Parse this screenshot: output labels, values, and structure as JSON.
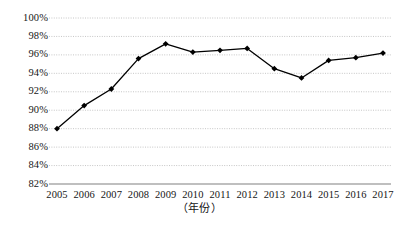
{
  "chart_data": {
    "type": "line",
    "title": "",
    "subtitle": "",
    "xlabel": "（年份）",
    "ylabel": "",
    "categories": [
      "2005",
      "2006",
      "2007",
      "2008",
      "2009",
      "2010",
      "2011",
      "2012",
      "2013",
      "2014",
      "2015",
      "2016",
      "2017"
    ],
    "values": [
      88.0,
      90.5,
      92.3,
      95.6,
      97.2,
      96.3,
      96.5,
      96.7,
      94.5,
      93.5,
      95.4,
      95.7,
      96.2
    ],
    "series": [
      {
        "name": "",
        "values": [
          88.0,
          90.5,
          92.3,
          95.6,
          97.2,
          96.3,
          96.5,
          96.7,
          94.5,
          93.5,
          95.4,
          95.7,
          96.2
        ]
      }
    ],
    "ylim": [
      82,
      100
    ],
    "ytick_values": [
      82,
      84,
      86,
      88,
      90,
      92,
      94,
      96,
      98,
      100
    ],
    "ytick_labels": [
      "82%",
      "84%",
      "86%",
      "88%",
      "90%",
      "92%",
      "94%",
      "96%",
      "98%",
      "100%"
    ],
    "xtick_labels": [
      "2005",
      "2006",
      "2007",
      "2008",
      "2009",
      "2010",
      "2011",
      "2012",
      "2013",
      "2014",
      "2015",
      "2016",
      "2017"
    ],
    "grid": true,
    "grid_axis": "y",
    "legend": false,
    "legend_position": "none",
    "marker": "diamond",
    "line_color": "#000000",
    "marker_color": "#000000",
    "grid_color": "#b8b8b8",
    "axis_color": "#808080",
    "annotations": []
  },
  "axis": {
    "x_title": "（年份）"
  }
}
